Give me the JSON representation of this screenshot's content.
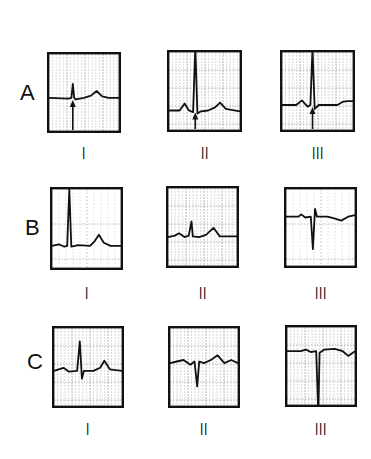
{
  "figure": {
    "rows": [
      {
        "letter": "A",
        "panels": [
          {
            "lead": "I",
            "box": [
              47,
              52,
              74,
              81
            ],
            "baseline": 0.57,
            "grid": "dense-vertical",
            "wave": "A1",
            "arrow": true,
            "arrow_x": 0.34
          },
          {
            "lead": "II",
            "box": [
              167,
              50,
              75,
              82
            ],
            "baseline": 0.75,
            "grid": "dense",
            "wave": "A2",
            "arrow": true,
            "arrow_x": 0.37
          },
          {
            "lead": "III",
            "box": [
              280,
              50,
              75,
              82
            ],
            "baseline": 0.68,
            "grid": "dense",
            "wave": "A3",
            "arrow": true,
            "arrow_x": 0.43
          }
        ]
      },
      {
        "letter": "B",
        "panels": [
          {
            "lead": "I",
            "box": [
              50,
              187,
              73,
              83
            ],
            "baseline": 0.72,
            "grid": "sparse",
            "wave": "B1",
            "arrow": false
          },
          {
            "lead": "II",
            "box": [
              166,
              186,
              73,
              82
            ],
            "baseline": 0.63,
            "grid": "dense",
            "wave": "B2",
            "arrow": false
          },
          {
            "lead": "III",
            "box": [
              284,
              187,
              73,
              81
            ],
            "baseline": 0.36,
            "grid": "sparse",
            "wave": "B3",
            "arrow": false
          }
        ]
      },
      {
        "letter": "C",
        "panels": [
          {
            "lead": "I",
            "box": [
              52,
              326,
              72,
              82
            ],
            "baseline": 0.55,
            "grid": "dense",
            "wave": "C1",
            "arrow": false
          },
          {
            "lead": "II",
            "box": [
              168,
              326,
              72,
              82
            ],
            "baseline": 0.45,
            "grid": "dense",
            "wave": "C2",
            "arrow": false
          },
          {
            "lead": "III",
            "box": [
              285,
              325,
              72,
              82
            ],
            "baseline": 0.31,
            "grid": "dense",
            "wave": "C3",
            "arrow": false
          }
        ]
      }
    ],
    "letter_positions": {
      "A": [
        20,
        82
      ],
      "B": [
        25,
        217
      ],
      "C": [
        27,
        351
      ]
    },
    "lead_label_y": {
      "A": 145,
      "B": 285,
      "C": 421
    },
    "colors": {
      "ink": "#111111",
      "grid": "#9a9a9a",
      "paper": "#ffffff"
    }
  }
}
